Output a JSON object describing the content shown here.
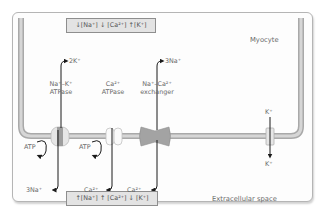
{
  "diagram": {
    "title_region_inside": "Myocyte",
    "title_region_outside": "Extracellular space",
    "intracellular_concentration_box": "↓[Na⁺] ↓ [Ca²⁺] ↑[K⁺]",
    "extracellular_concentration_box": "↑[Na⁺] ↑ [Ca²⁺] ↓ [K⁺]",
    "transporters": [
      {
        "name_line1": "Na⁺–K⁺",
        "name_line2": "ATPase",
        "inward_ion": "2K⁺",
        "outward_ion": "3Na⁺",
        "energy": "ATP"
      },
      {
        "name_line1": "Ca²⁺",
        "name_line2": "ATPase",
        "outward_ion": "Ca²⁺",
        "energy": "ATP"
      },
      {
        "name_line1": "Na⁺–Ca²⁺",
        "name_line2": "exchanger",
        "inward_ion": "3Na⁺",
        "outward_ion": "Ca²⁺"
      },
      {
        "name_line1": "K⁺ channel",
        "inside_ion": "K⁺",
        "outside_ion": "K⁺"
      }
    ],
    "colors": {
      "membrane": "#c9c9c9",
      "membrane_edge": "#a9a9a9",
      "exchanger": "#a3a3a3",
      "arrow": "#1a1a1a",
      "box_fill": "#e3e3e3"
    }
  }
}
